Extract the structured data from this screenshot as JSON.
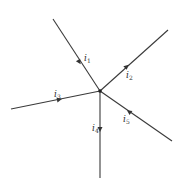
{
  "diagram": {
    "type": "circuit-node-currents",
    "node": {
      "x": 100,
      "y": 91
    },
    "colors": {
      "line": "#3a3a3a",
      "background": "#ffffff"
    },
    "branches": [
      {
        "id": "i1",
        "label": "i",
        "subscript": "1",
        "end": {
          "x": 53,
          "y": 19
        },
        "direction": "into-node",
        "label_pos": {
          "x": 84,
          "y": 60
        }
      },
      {
        "id": "i2",
        "label": "i",
        "subscript": "2",
        "end": {
          "x": 168,
          "y": 30
        },
        "direction": "out-of-node",
        "label_pos": {
          "x": 126,
          "y": 78
        }
      },
      {
        "id": "i3",
        "label": "i",
        "subscript": "3",
        "end": {
          "x": 11,
          "y": 109
        },
        "direction": "into-node",
        "label_pos": {
          "x": 54,
          "y": 98
        }
      },
      {
        "id": "i4",
        "label": "i",
        "subscript": "4",
        "end": {
          "x": 100,
          "y": 178
        },
        "direction": "out-of-node",
        "label_pos": {
          "x": 92,
          "y": 132
        }
      },
      {
        "id": "i5",
        "label": "i",
        "subscript": "5",
        "end": {
          "x": 172,
          "y": 141
        },
        "direction": "into-node",
        "label_pos": {
          "x": 123,
          "y": 122
        }
      }
    ]
  }
}
